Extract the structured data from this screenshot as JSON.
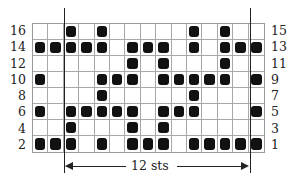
{
  "chart": {
    "title": "",
    "columns": 15,
    "rows": 8,
    "left_labels": [
      "16",
      "14",
      "12",
      "10",
      "8",
      "6",
      "4",
      "2"
    ],
    "right_labels": [
      "15",
      "13",
      "11",
      "9",
      "7",
      "5",
      "3",
      "1"
    ],
    "filled_columns_by_row": [
      [
        3,
        5,
        11,
        13
      ],
      [
        1,
        2,
        3,
        4,
        5,
        7,
        8,
        9,
        11,
        13,
        14,
        15
      ],
      [
        7,
        9,
        13
      ],
      [
        1,
        5,
        6,
        7,
        9,
        10,
        11,
        12,
        13,
        15
      ],
      [
        5,
        11
      ],
      [
        1,
        3,
        4,
        5,
        6,
        7,
        9,
        10,
        11,
        15
      ],
      [
        3,
        7,
        9
      ],
      [
        1,
        2,
        3,
        5,
        7,
        8,
        9,
        11,
        12,
        13,
        14,
        15
      ]
    ],
    "repeat_label": "12 sts",
    "colors": {
      "filled": "#111111",
      "grid": "#a8a8a8",
      "background": "#ffffff"
    }
  }
}
